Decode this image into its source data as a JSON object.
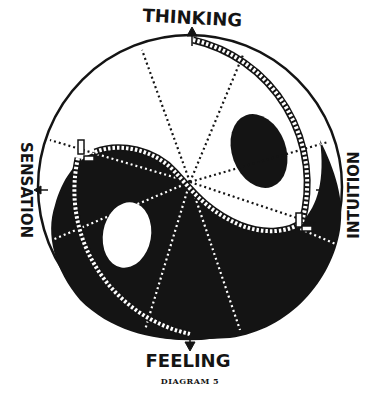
{
  "diagram": {
    "caption": "DIAGRAM 5",
    "labels": {
      "top": "THINKING",
      "bottom": "FEELING",
      "left": "SENSATION",
      "right": "INTUITION"
    },
    "colors": {
      "ink": "#141414",
      "paper": "#ffffff"
    },
    "circle": {
      "cx": 190,
      "cy": 187,
      "r": 153
    }
  }
}
